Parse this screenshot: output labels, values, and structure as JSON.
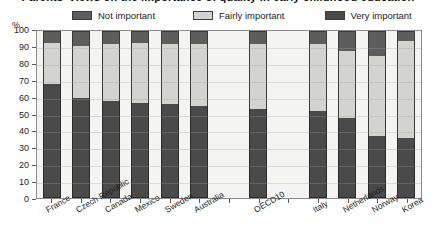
{
  "chart_data": {
    "type": "bar",
    "subtype": "stacked-100-percent",
    "title": "Parents' views on the importance of quality in early childhood education",
    "xlabel": "",
    "ylabel": "%",
    "ylim": [
      0,
      100
    ],
    "yticks": [
      0,
      10,
      20,
      30,
      40,
      50,
      60,
      70,
      80,
      90,
      100
    ],
    "grid": true,
    "legend_position": "top",
    "categories": [
      "France",
      "Czech Republic",
      "Canada",
      "Mexico",
      "Sweden",
      "Australia",
      "",
      "OECD10",
      "",
      "Italy",
      "Netherlands",
      "Norway",
      "Korea"
    ],
    "series": [
      {
        "name": "Very important",
        "color": "#4a4a4a",
        "values": [
          68,
          60,
          58,
          57,
          56,
          55,
          null,
          53,
          null,
          52,
          48,
          37,
          36
        ]
      },
      {
        "name": "Fairly important",
        "color": "#d3d3d0",
        "values": [
          25,
          31,
          34,
          36,
          36,
          37,
          null,
          39,
          null,
          40,
          40,
          48,
          58
        ]
      },
      {
        "name": "Not important",
        "color": "#5d5d5d",
        "values": [
          7,
          9,
          8,
          7,
          8,
          8,
          null,
          8,
          null,
          8,
          12,
          15,
          6
        ]
      }
    ]
  },
  "axis": {
    "unit_label": "%"
  },
  "legend": {
    "items": [
      {
        "label": "Not important",
        "color": "#5d5d5d"
      },
      {
        "label": "Fairly important",
        "color": "#d3d3d0"
      },
      {
        "label": "Very important",
        "color": "#4a4a4a"
      }
    ]
  }
}
